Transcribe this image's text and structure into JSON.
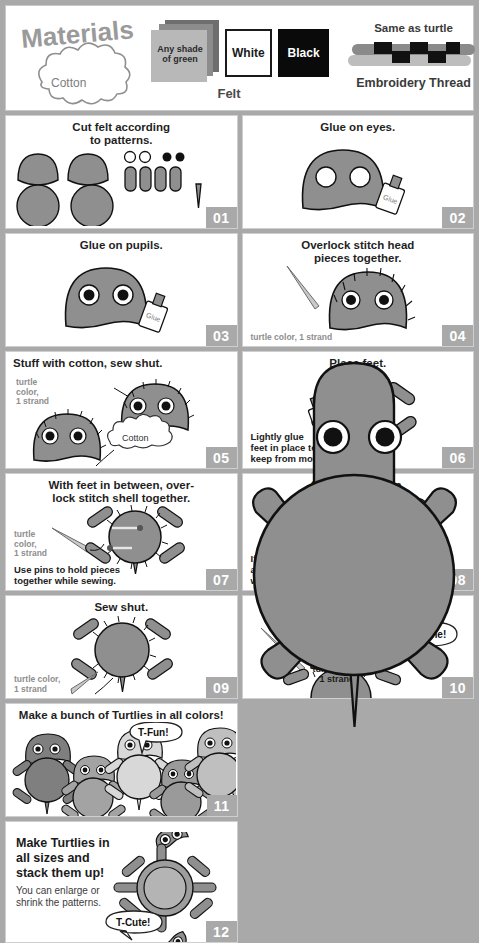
{
  "materials": {
    "title": "Materials",
    "cotton_label": "Cotton",
    "felt": {
      "green_label": "Any shade\nof green",
      "green_line1": "Any shade",
      "green_line2": "of green",
      "white_label": "White",
      "black_label": "Black",
      "caption": "Felt"
    },
    "thread": {
      "top_note": "Same as turtle",
      "caption": "Embroidery Thread"
    }
  },
  "steps": [
    {
      "number": "01",
      "title": "Cut felt according to patterns.",
      "title_line1": "Cut felt according",
      "title_line2": "to patterns."
    },
    {
      "number": "02",
      "title": "Glue on eyes.",
      "glue_label": "Glue"
    },
    {
      "number": "03",
      "title": "Glue on pupils.",
      "glue_label": "Glue"
    },
    {
      "number": "04",
      "title": "Overlock stitch head pieces together.",
      "title_line1": "Overlock stitch head",
      "title_line2": "pieces together.",
      "note": "turtle color, 1 strand"
    },
    {
      "number": "05",
      "title": "Stuff with cotton, sew shut.",
      "note_line1": "turtle",
      "note_line2": "color,",
      "note_line3": "1 strand",
      "cotton_label": "Cotton"
    },
    {
      "number": "06",
      "title": "Place feet.",
      "glue_label": "Glue",
      "note_line1": "Lightly glue",
      "note_line2": "feet in place to",
      "note_line3": "keep from moving."
    },
    {
      "number": "07",
      "title": "With feet in between, over-lock stitch shell together.",
      "title_line1": "With feet in between, over-",
      "title_line2": "lock stitch shell together.",
      "note_line1": "turtle",
      "note_line2": "color,",
      "note_line3": "1 strand",
      "bottom_line1": "Use pins to hold pieces",
      "bottom_line2": "together while sewing."
    },
    {
      "number": "08",
      "title": "Stuff with cotton.",
      "cotton_label": "Cotton",
      "bottom_line1": "If you use",
      "bottom_line2": "a lot of cotton, the shell",
      "bottom_line3": "will be nice and round."
    },
    {
      "number": "09",
      "title": "Sew shut.",
      "note_line1": "turtle color,",
      "note_line2": "1 strand"
    },
    {
      "number": "10",
      "title": "Sew head and shell together.",
      "title_line1": "Sew head and shell",
      "title_line2": "together.",
      "bubble": "T-Done!",
      "note_line1": "turtle color,",
      "note_line2": "1 strand"
    },
    {
      "number": "11",
      "title": "Make a bunch of Turtlies in all colors!",
      "bubble": "T-Fun!"
    },
    {
      "number": "12",
      "title_line1": "Make Turtlies in",
      "title_line2": "all sizes and",
      "title_line3": "stack them up!",
      "sub_line1": "You can enlarge or",
      "sub_line2": "shrink the patterns.",
      "bubble": "T-Cute!"
    }
  ],
  "colors": {
    "background": "#a9a9a9",
    "panel": "#ffffff",
    "badge": "#a9a9a9",
    "turtle_body": "#8f8f8f",
    "note_gray": "#8e8e8e",
    "ink": "#1a1a1a"
  },
  "turtle_palette": [
    "#7f7f7f",
    "#a3a3a3",
    "#d8d8d8",
    "#9a9a9a",
    "#bfbfbf"
  ]
}
